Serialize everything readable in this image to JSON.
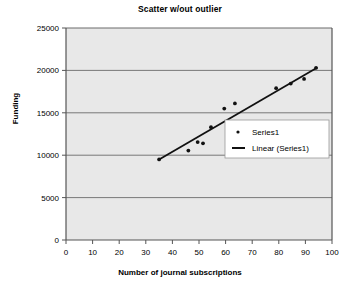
{
  "chart_data": {
    "type": "scatter",
    "title": "Scatter w/out outlier",
    "xlabel": "Number of journal subscriptions",
    "ylabel": "Funding",
    "xlim": [
      0,
      100
    ],
    "ylim": [
      0,
      25000
    ],
    "xticks": [
      "0",
      "10",
      "20",
      "30",
      "40",
      "50",
      "60",
      "70",
      "80",
      "90",
      "100"
    ],
    "yticks": [
      "0",
      "5000",
      "10000",
      "15000",
      "20000",
      "25000"
    ],
    "grid": "horizontal",
    "legend_position": "center-right",
    "series": [
      {
        "name": "Series1",
        "marker": "dot",
        "points": [
          {
            "x": 35,
            "y": 9500
          },
          {
            "x": 46,
            "y": 10550
          },
          {
            "x": 49.5,
            "y": 11550
          },
          {
            "x": 51.5,
            "y": 11400
          },
          {
            "x": 54.5,
            "y": 13300
          },
          {
            "x": 59.5,
            "y": 15500
          },
          {
            "x": 63.5,
            "y": 16100
          },
          {
            "x": 79,
            "y": 17900
          },
          {
            "x": 84.5,
            "y": 18450
          },
          {
            "x": 89.5,
            "y": 19000
          },
          {
            "x": 94,
            "y": 20300
          }
        ]
      },
      {
        "name": "Linear (Series1)",
        "marker": "line",
        "trendline": {
          "x1": 35,
          "y1": 9500,
          "x2": 94.5,
          "y2": 20350
        }
      }
    ]
  },
  "colors": {
    "plot_background": "#e8e8e8",
    "gridline": "#6b6b6b",
    "axis": "#555555",
    "marker": "#111111",
    "trendline": "#111111",
    "legend_background": "#ffffff",
    "legend_border": "#9a9a9a",
    "text": "#000000"
  },
  "legend": {
    "entries": [
      {
        "label": "Series1",
        "symbol": "dot"
      },
      {
        "label": "Linear (Series1)",
        "symbol": "line"
      }
    ]
  }
}
